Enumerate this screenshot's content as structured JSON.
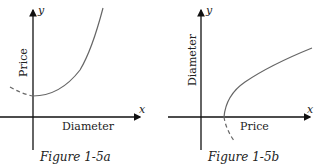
{
  "figures": [
    {
      "caption": "Figure 1-5a",
      "x_axis_symbol": "x",
      "y_axis_symbol": "y",
      "x_label": "Diameter",
      "y_label": "Price",
      "curve": "upward parabola, vertex on y-axis above origin; dashed extension to the left"
    },
    {
      "caption": "Figure 1-5b",
      "x_axis_symbol": "x",
      "y_axis_symbol": "y",
      "x_label": "Price",
      "y_label": "Diameter",
      "curve": "square-root shaped curve starting on x-axis right of origin; dashed extension below x-axis"
    }
  ],
  "colors": {
    "axis": "#111111",
    "curve": "#666666"
  }
}
